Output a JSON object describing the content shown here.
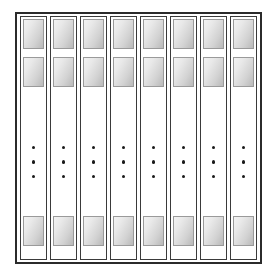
{
  "figure": {
    "name": "column-array-diagram",
    "type": "schematic",
    "colors": {
      "background": "#ffffff",
      "frame_stroke": "#2b2b2b",
      "strip_stroke": "#3a3a3a",
      "block_stroke": "#9a9a9a",
      "block_gradient_light": "#f3f3f3",
      "block_gradient_dark": "#b9b9b9",
      "dot_fill": "#1a1a1a"
    },
    "outer_frame": {
      "label": "",
      "stroke_width": 2
    },
    "columns": [
      {
        "index": 1,
        "label": "",
        "blocks": [
          {
            "position": "top",
            "label": ""
          },
          {
            "position": "middle",
            "label": ""
          },
          {
            "position": "bottom",
            "label": ""
          }
        ],
        "ellipsis": {
          "dot_count": 3,
          "glyph": "vertical-ellipsis"
        }
      },
      {
        "index": 2,
        "label": "",
        "blocks": [
          {
            "position": "top",
            "label": ""
          },
          {
            "position": "middle",
            "label": ""
          },
          {
            "position": "bottom",
            "label": ""
          }
        ],
        "ellipsis": {
          "dot_count": 3,
          "glyph": "vertical-ellipsis"
        }
      },
      {
        "index": 3,
        "label": "",
        "blocks": [
          {
            "position": "top",
            "label": ""
          },
          {
            "position": "middle",
            "label": ""
          },
          {
            "position": "bottom",
            "label": ""
          }
        ],
        "ellipsis": {
          "dot_count": 3,
          "glyph": "vertical-ellipsis"
        }
      },
      {
        "index": 4,
        "label": "",
        "blocks": [
          {
            "position": "top",
            "label": ""
          },
          {
            "position": "middle",
            "label": ""
          },
          {
            "position": "bottom",
            "label": ""
          }
        ],
        "ellipsis": {
          "dot_count": 3,
          "glyph": "vertical-ellipsis"
        }
      },
      {
        "index": 5,
        "label": "",
        "blocks": [
          {
            "position": "top",
            "label": ""
          },
          {
            "position": "middle",
            "label": ""
          },
          {
            "position": "bottom",
            "label": ""
          }
        ],
        "ellipsis": {
          "dot_count": 3,
          "glyph": "vertical-ellipsis"
        }
      },
      {
        "index": 6,
        "label": "",
        "blocks": [
          {
            "position": "top",
            "label": ""
          },
          {
            "position": "middle",
            "label": ""
          },
          {
            "position": "bottom",
            "label": ""
          }
        ],
        "ellipsis": {
          "dot_count": 3,
          "glyph": "vertical-ellipsis"
        }
      },
      {
        "index": 7,
        "label": "",
        "blocks": [
          {
            "position": "top",
            "label": ""
          },
          {
            "position": "middle",
            "label": ""
          },
          {
            "position": "bottom",
            "label": ""
          }
        ],
        "ellipsis": {
          "dot_count": 3,
          "glyph": "vertical-ellipsis"
        }
      },
      {
        "index": 8,
        "label": "",
        "blocks": [
          {
            "position": "top",
            "label": ""
          },
          {
            "position": "middle",
            "label": ""
          },
          {
            "position": "bottom",
            "label": ""
          }
        ],
        "ellipsis": {
          "dot_count": 3,
          "glyph": "vertical-ellipsis"
        }
      }
    ]
  }
}
